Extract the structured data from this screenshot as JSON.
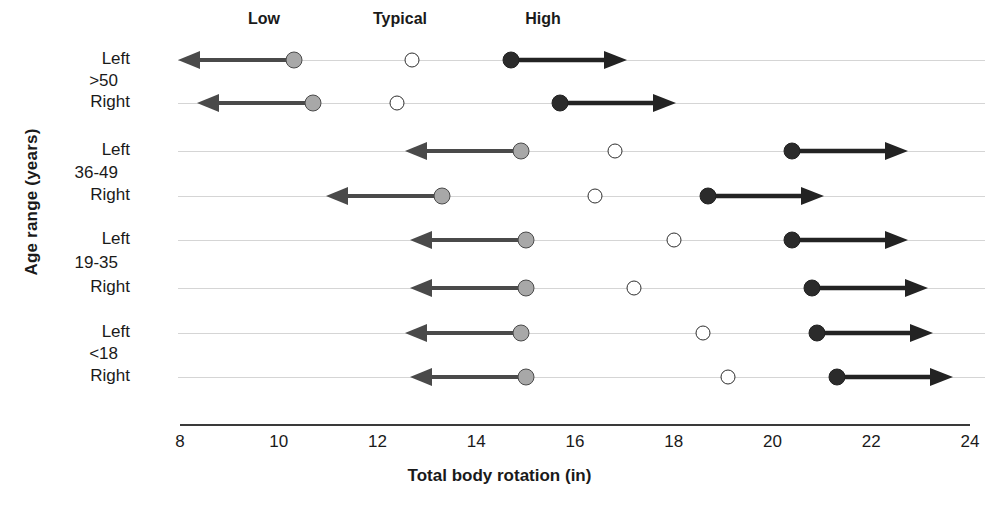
{
  "chart_data": {
    "type": "scatter",
    "title": "",
    "xlabel": "Total body rotation (in)",
    "ylabel": "Age range (years)",
    "xlim": [
      8,
      24
    ],
    "xticks": [
      8,
      10,
      12,
      14,
      16,
      18,
      20,
      22,
      24
    ],
    "grid": false,
    "legend_position": "top",
    "legend": [
      {
        "name": "Low",
        "marker": "gray-filled-circle-with-left-arrow",
        "color": "#a8a8a8"
      },
      {
        "name": "Typical",
        "marker": "open-circle",
        "color": "#ffffff"
      },
      {
        "name": "High",
        "marker": "black-filled-circle-with-right-arrow",
        "color": "#2b2b2b"
      }
    ],
    "groups": [
      {
        "label": ">50",
        "rows": [
          0,
          1
        ]
      },
      {
        "label": "36-49",
        "rows": [
          2,
          3
        ]
      },
      {
        "label": "19-35",
        "rows": [
          4,
          5
        ]
      },
      {
        "label": "<18",
        "rows": [
          6,
          7
        ]
      }
    ],
    "categories": [
      "Left",
      "Right",
      "Left",
      "Right",
      "Left",
      "Right",
      "Left",
      "Right"
    ],
    "series": [
      {
        "name": "Low",
        "values": [
          10.3,
          10.7,
          14.9,
          13.3,
          15.0,
          15.0,
          14.9,
          15.0
        ]
      },
      {
        "name": "Typical",
        "values": [
          12.7,
          12.4,
          16.8,
          16.4,
          18.0,
          17.2,
          18.6,
          19.1
        ]
      },
      {
        "name": "High",
        "values": [
          14.7,
          15.7,
          20.4,
          18.7,
          20.4,
          20.8,
          20.9,
          21.3
        ]
      }
    ]
  },
  "axis": {
    "y_title": "Age range (years)",
    "x_title": "Total body rotation (in)",
    "x_tick_labels": [
      "8",
      "10",
      "12",
      "14",
      "16",
      "18",
      "20",
      "22",
      "24"
    ]
  },
  "legend": {
    "low": "Low",
    "typical": "Typical",
    "high": "High"
  },
  "group_labels": {
    "g0": ">50",
    "g1": "36-49",
    "g2": "19-35",
    "g3": "<18"
  },
  "side_labels": {
    "r0": "Left",
    "r1": "Right",
    "r2": "Left",
    "r3": "Right",
    "r4": "Left",
    "r5": "Right",
    "r6": "Left",
    "r7": "Right"
  }
}
